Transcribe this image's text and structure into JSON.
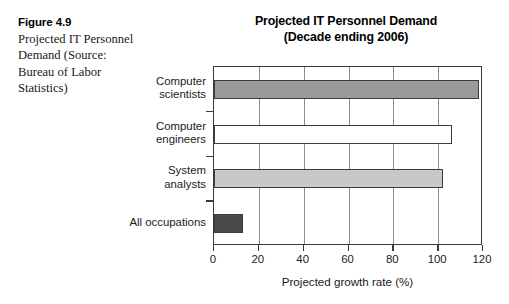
{
  "caption": {
    "figure_label": "Figure 4.9",
    "body": "Projected IT Personnel Demand (Source: Bureau of Labor Statistics)"
  },
  "chart_data": {
    "type": "bar",
    "orientation": "horizontal",
    "title": "Projected IT Personnel Demand",
    "subtitle": "(Decade ending 2006)",
    "categories": [
      "Computer scientists",
      "Computer engineers",
      "System analysts",
      "All occupations"
    ],
    "category_lines": [
      [
        "Computer",
        "scientists"
      ],
      [
        "Computer",
        "engineers"
      ],
      [
        "System",
        "analysts"
      ],
      [
        "All occupations"
      ]
    ],
    "values": [
      118,
      106,
      102,
      13
    ],
    "bar_colors": [
      "#9a9a9a",
      "#ffffff",
      "#c8c8c8",
      "#4a4a4a"
    ],
    "bar_edge_color": "#3b3b3b",
    "xlabel": "Projected growth rate (%)",
    "ylabel": "",
    "xlim": [
      0,
      120
    ],
    "xticks": [
      0,
      20,
      40,
      60,
      80,
      100,
      120
    ],
    "xtick_labels": [
      "0",
      "20",
      "40",
      "60",
      "80",
      "100",
      "120"
    ],
    "grid": "vertical",
    "grid_color": "#8d8d8d",
    "legend": "none"
  }
}
